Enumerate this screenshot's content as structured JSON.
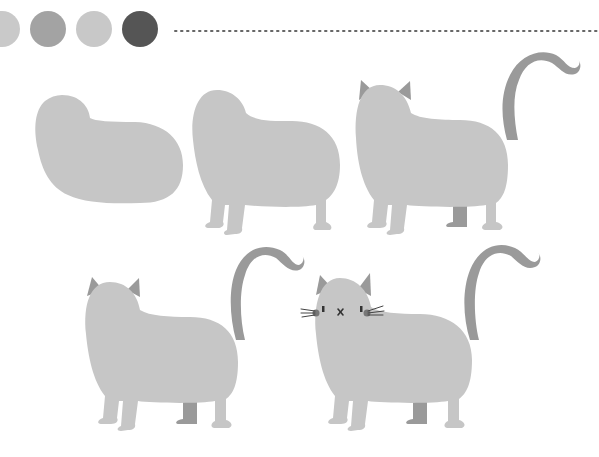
{
  "illustration": {
    "title": "How to draw a cat step by step",
    "step_count": 5,
    "steps": [
      {
        "label": "Step 1",
        "description": "Head and body blob"
      },
      {
        "label": "Step 2",
        "description": "Add legs"
      },
      {
        "label": "Step 3",
        "description": "Add ears and tail"
      },
      {
        "label": "Step 4",
        "description": "Refine shape"
      },
      {
        "label": "Step 5",
        "description": "Add face and whiskers"
      }
    ]
  },
  "palette": {
    "swatches": [
      "#c9c9c9",
      "#a3a3a3",
      "#c8c8c8",
      "#555555"
    ],
    "body_color": "#c6c6c6",
    "accent_color": "#9a9a9a",
    "face_color": "#444444"
  },
  "divider": {
    "style": "dotted",
    "color": "#666666"
  }
}
